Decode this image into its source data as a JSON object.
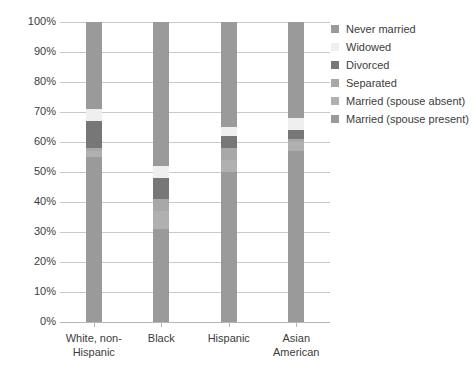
{
  "chart_data": {
    "type": "bar",
    "subtype": "stacked-bar-100-percent",
    "title": "",
    "xlabel": "",
    "ylabel": "",
    "ylim": [
      0,
      100
    ],
    "y_tick_labels": [
      "100%",
      "90%",
      "80%",
      "70%",
      "60%",
      "50%",
      "40%",
      "30%",
      "20%",
      "10%",
      "0%"
    ],
    "y_tick_values": [
      100,
      90,
      80,
      70,
      60,
      50,
      40,
      30,
      20,
      10,
      0
    ],
    "grid": true,
    "legend_position": "right",
    "categories": [
      "White, non-Hispanic",
      "Black",
      "Hispanic",
      "Asian American"
    ],
    "category_lines": [
      [
        "White, non-",
        "Hispanic"
      ],
      [
        "Black"
      ],
      [
        "Hispanic"
      ],
      [
        "Asian",
        "American"
      ]
    ],
    "series": [
      {
        "name": "Married (spouse present)",
        "color": "#9a9a9a",
        "values": [
          55,
          31,
          50,
          57
        ]
      },
      {
        "name": "Married (spouse absent)",
        "color": "#b0b0b0",
        "values": [
          2,
          6,
          4,
          3
        ]
      },
      {
        "name": "Separated",
        "color": "#a8a8a8",
        "values": [
          1,
          4,
          4,
          1
        ]
      },
      {
        "name": "Divorced",
        "color": "#777777",
        "values": [
          9,
          7,
          4,
          3
        ]
      },
      {
        "name": "Widowed",
        "color": "#efefef",
        "values": [
          4,
          4,
          3,
          4
        ]
      },
      {
        "name": "Never married",
        "color": "#9a9a9a",
        "values": [
          29,
          48,
          35,
          32
        ]
      }
    ]
  },
  "legend": {
    "items": [
      {
        "label": "Never married",
        "color": "#9a9a9a"
      },
      {
        "label": "Widowed",
        "color": "#efefef"
      },
      {
        "label": "Divorced",
        "color": "#777777"
      },
      {
        "label": "Separated",
        "color": "#a8a8a8"
      },
      {
        "label": "Married (spouse absent)",
        "color": "#b0b0b0"
      },
      {
        "label": "Married (spouse present)",
        "color": "#9a9a9a"
      }
    ]
  },
  "style": {
    "grid_color": "#c9c9c9",
    "axis_color": "#b5b5b5",
    "text_color": "#3c3c3c",
    "background": "#ffffff"
  }
}
